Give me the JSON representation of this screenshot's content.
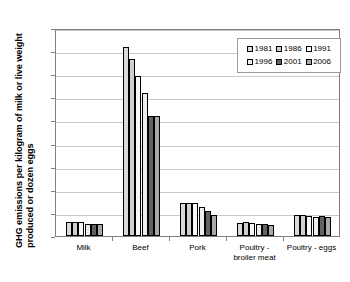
{
  "chart_data": {
    "type": "bar",
    "title": "",
    "xlabel": "",
    "ylabel": "GHG emissions per kilogram of milk or live weight produced or dozen eggs",
    "ylabel_line1": "GHG emissions per kilogram of milk or live weight",
    "ylabel_line2": "produced or dozen eggs",
    "ylim": [
      0,
      18
    ],
    "ytick_step": 2,
    "yticks": [
      "0",
      "2",
      "4",
      "6",
      "8",
      "10",
      "12",
      "14",
      "16",
      "18"
    ],
    "grid": true,
    "grid_axis": "y",
    "legend_position": "top-right",
    "categories": [
      "Milk",
      "Beef",
      "Pork",
      "Poultry - broiler meat",
      "Poultry - eggs"
    ],
    "category_labels": [
      {
        "line1": "Milk",
        "line2": ""
      },
      {
        "line1": "Beef",
        "line2": ""
      },
      {
        "line1": "Pork",
        "line2": ""
      },
      {
        "line1": "Poultry -",
        "line2": "broiler meat"
      },
      {
        "line1": "Poultry - eggs",
        "line2": ""
      }
    ],
    "series": [
      {
        "name": "1981",
        "color": "#d9d9d9",
        "values": [
          1.25,
          16.35,
          2.9,
          1.15,
          1.8
        ]
      },
      {
        "name": "1986",
        "color": "#cfcfcf",
        "values": [
          1.25,
          15.3,
          2.9,
          1.22,
          1.78
        ]
      },
      {
        "name": "1991",
        "color": "#f7f7f7",
        "values": [
          1.18,
          13.85,
          2.85,
          1.1,
          1.7
        ]
      },
      {
        "name": "1996",
        "color": "#eeeeee",
        "values": [
          1.05,
          12.4,
          2.52,
          1.0,
          1.62
        ]
      },
      {
        "name": "2001",
        "color": "#626262",
        "values": [
          1.06,
          10.35,
          2.2,
          1.0,
          1.7
        ]
      },
      {
        "name": "2006",
        "color": "#a8a8a8",
        "values": [
          1.0,
          10.42,
          1.85,
          0.95,
          1.62
        ]
      }
    ],
    "legend": {
      "row1": [
        "1981",
        "1986",
        "1991"
      ],
      "row2": [
        "1996",
        "2001",
        "2006"
      ]
    }
  }
}
